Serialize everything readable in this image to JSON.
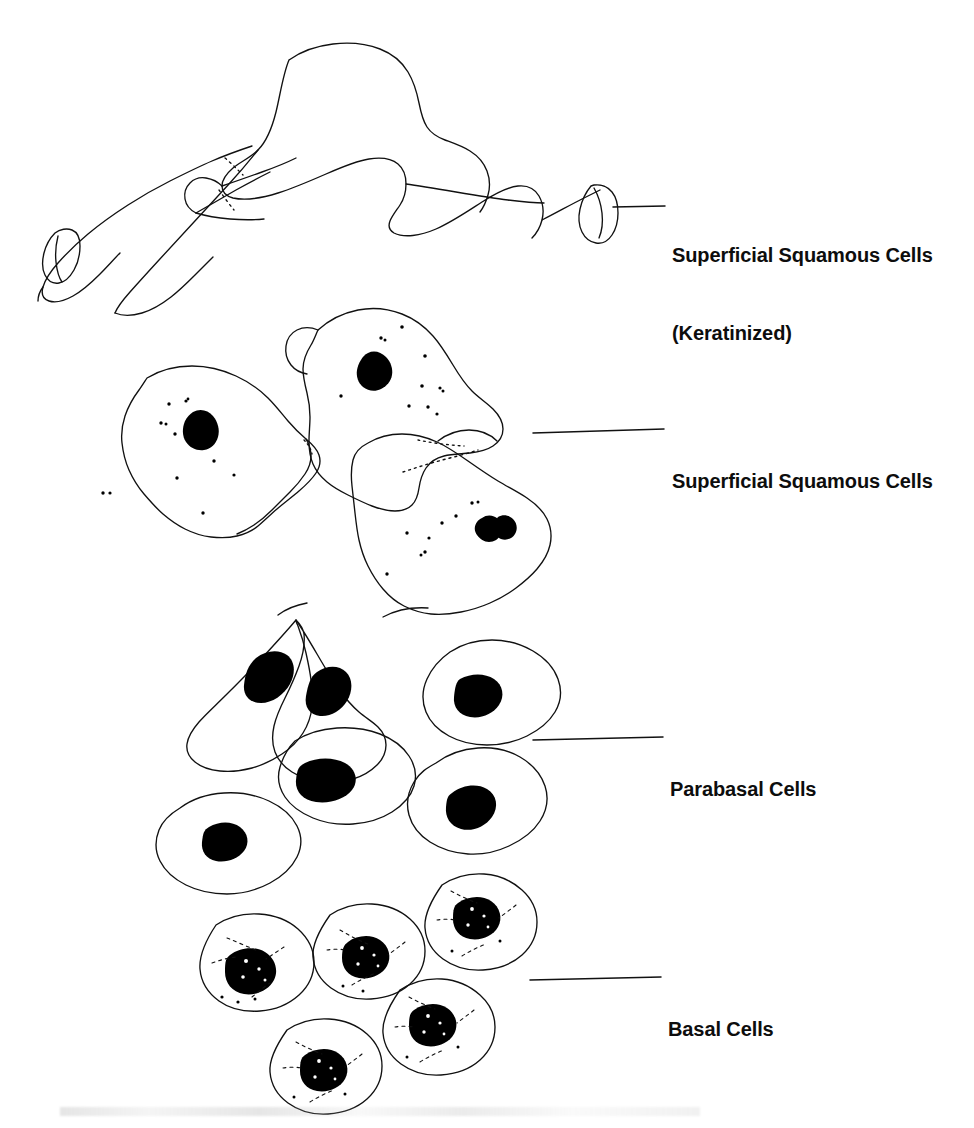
{
  "figure": {
    "background_color": "#ffffff",
    "ink_color": "#111111",
    "width": 974,
    "height": 1128
  },
  "labels": [
    {
      "id": "superficial-squamous-keratinized",
      "line1": "Superficial Squamous Cells",
      "line2": "(Keratinized)",
      "text_x": 672,
      "text_y": 190,
      "leader": {
        "x1": 613,
        "y1": 207,
        "x2": 665,
        "y2": 206
      }
    },
    {
      "id": "superficial-squamous",
      "line1": "Superficial Squamous Cells",
      "line2": "",
      "text_x": 672,
      "text_y": 416,
      "leader": {
        "x1": 533,
        "y1": 433,
        "x2": 664,
        "y2": 429
      }
    },
    {
      "id": "parabasal",
      "line1": "Parabasal Cells",
      "line2": "",
      "text_x": 670,
      "text_y": 724,
      "leader": {
        "x1": 533,
        "y1": 740,
        "x2": 663,
        "y2": 737
      }
    },
    {
      "id": "basal",
      "line1": "Basal Cells",
      "line2": "",
      "text_x": 668,
      "text_y": 964,
      "leader": {
        "x1": 530,
        "y1": 980,
        "x2": 661,
        "y2": 977
      }
    }
  ],
  "cell_groups": [
    {
      "id": "keratinized-squames",
      "name": "Superficial Squamous Cells (Keratinized)",
      "cell_count": 3,
      "nuclei": "absent (anucleate)",
      "granules": "none",
      "description": "Large flat folded anucleate keratinized squames with creased and curled edges"
    },
    {
      "id": "superficial-squames",
      "name": "Superficial Squamous Cells",
      "cell_count": 3,
      "nuclei": "small dense pyknotic",
      "granules": "fine keratohyaline stipple",
      "description": "Large polygonal cells with small solid dark pyknotic nuclei and scattered fine granules"
    },
    {
      "id": "parabasal-cells",
      "name": "Parabasal Cells",
      "cell_count": 6,
      "nuclei": "large solid oval",
      "granules": "none",
      "description": "Rounded to oval cells with large solid black oval nuclei and increased nuclear to cytoplasmic ratio"
    },
    {
      "id": "basal-cells",
      "name": "Basal Cells",
      "cell_count": 5,
      "nuclei": "large round vacuolated",
      "granules": "dashed cytoplasmic texture",
      "description": "Small round cells with large central dark nuclei showing light vacuoles and stippled cytoplasm"
    }
  ]
}
